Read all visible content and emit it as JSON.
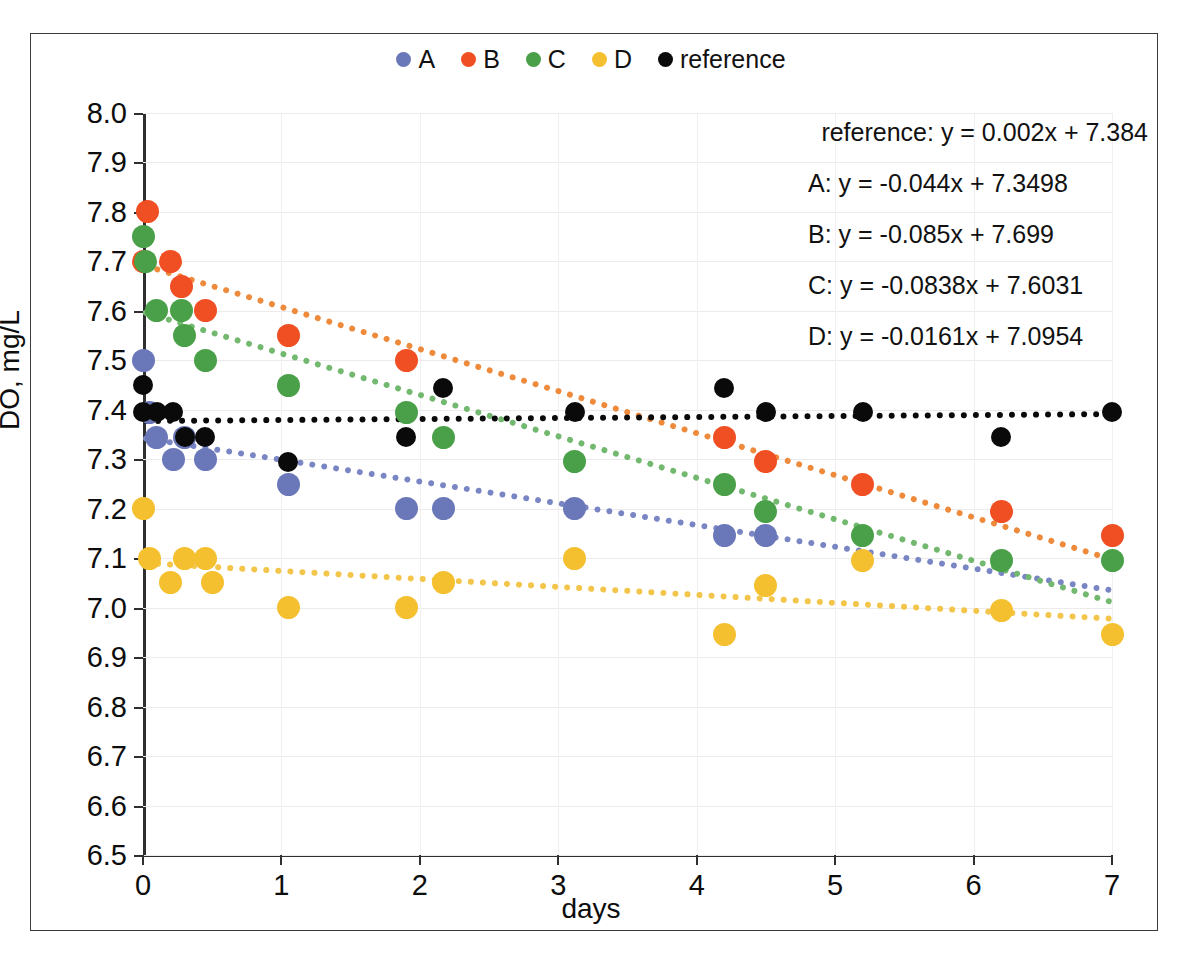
{
  "chart_data": {
    "type": "scatter",
    "title": "",
    "xlabel": "days",
    "ylabel": "DO, mg/L",
    "xlim": [
      0,
      7
    ],
    "ylim": [
      6.5,
      8.0
    ],
    "xticks": [
      "0",
      "1",
      "2",
      "3",
      "4",
      "5",
      "6",
      "7"
    ],
    "yticks": [
      "8.0",
      "7.9",
      "7.8",
      "7.7",
      "7.6",
      "7.5",
      "7.4",
      "7.3",
      "7.2",
      "7.1",
      "7.0",
      "6.9",
      "6.8",
      "6.7",
      "6.6",
      "6.5"
    ],
    "grid": true,
    "legend_position": "top-center",
    "series": [
      {
        "name": "A",
        "color": "#6a77b8",
        "points": [
          [
            0.0,
            7.5
          ],
          [
            0.05,
            7.395
          ],
          [
            0.1,
            7.345
          ],
          [
            0.22,
            7.3
          ],
          [
            0.3,
            7.345
          ],
          [
            0.45,
            7.3
          ],
          [
            1.05,
            7.25
          ],
          [
            1.9,
            7.2
          ],
          [
            2.17,
            7.2
          ],
          [
            3.12,
            7.2
          ],
          [
            4.2,
            7.145
          ],
          [
            4.5,
            7.145
          ]
        ],
        "trend": {
          "slope": -0.044,
          "intercept": 7.3498,
          "equation": "A: y = -0.044x + 7.3498"
        }
      },
      {
        "name": "B",
        "color": "#f04e23",
        "points": [
          [
            0.03,
            7.8
          ],
          [
            0.0,
            7.7
          ],
          [
            0.2,
            7.7
          ],
          [
            0.28,
            7.65
          ],
          [
            0.45,
            7.6
          ],
          [
            1.05,
            7.55
          ],
          [
            1.9,
            7.5
          ],
          [
            4.2,
            7.345
          ],
          [
            4.5,
            7.295
          ],
          [
            5.2,
            7.25
          ],
          [
            6.2,
            7.195
          ],
          [
            7.0,
            7.145
          ]
        ],
        "trend": {
          "slope": -0.085,
          "intercept": 7.699,
          "equation": "B: y = -0.085x + 7.699"
        }
      },
      {
        "name": "C",
        "color": "#44a councils"
      }
    ]
  },
  "legend": {
    "items": [
      {
        "label": "A",
        "color": "#6a77b8"
      },
      {
        "label": "B",
        "color": "#f04e23"
      },
      {
        "label": "C",
        "color": "#4aa048"
      },
      {
        "label": "D",
        "color": "#f5c030"
      },
      {
        "label": "reference",
        "color": "#0a0a0a"
      }
    ]
  },
  "axes": {
    "x_title": "days",
    "y_title": "DO, mg/L",
    "x_ticks": [
      "0",
      "1",
      "2",
      "3",
      "4",
      "5",
      "6",
      "7"
    ],
    "y_ticks": [
      "8.0",
      "7.9",
      "7.8",
      "7.7",
      "7.6",
      "7.5",
      "7.4",
      "7.3",
      "7.2",
      "7.1",
      "7.0",
      "6.9",
      "6.8",
      "6.7",
      "6.6",
      "6.5"
    ]
  },
  "equations": [
    "reference: y = 0.002x + 7.384",
    "A: y = -0.044x + 7.3498",
    "B: y = -0.085x + 7.699",
    "C: y = -0.0838x + 7.6031",
    "D: y = -0.0161x + 7.0954"
  ],
  "series_data": {
    "A": {
      "color": "#6a77b8",
      "trend_color": "#7a86c4",
      "slope": -0.044,
      "intercept": 7.3498,
      "points": [
        [
          0.0,
          7.5
        ],
        [
          0.05,
          7.395
        ],
        [
          0.1,
          7.345
        ],
        [
          0.22,
          7.3
        ],
        [
          0.3,
          7.345
        ],
        [
          0.45,
          7.3
        ],
        [
          1.05,
          7.25
        ],
        [
          1.9,
          7.2
        ],
        [
          2.17,
          7.2
        ],
        [
          3.12,
          7.2
        ],
        [
          4.2,
          7.145
        ],
        [
          4.5,
          7.145
        ]
      ]
    },
    "B": {
      "color": "#f04e23",
      "trend_color": "#ed8a3c",
      "slope": -0.085,
      "intercept": 7.699,
      "points": [
        [
          0.03,
          7.8
        ],
        [
          0.0,
          7.7
        ],
        [
          0.2,
          7.7
        ],
        [
          0.28,
          7.65
        ],
        [
          0.45,
          7.6
        ],
        [
          1.05,
          7.55
        ],
        [
          1.9,
          7.5
        ],
        [
          4.2,
          7.345
        ],
        [
          4.5,
          7.295
        ],
        [
          5.2,
          7.25
        ],
        [
          6.2,
          7.195
        ],
        [
          7.0,
          7.145
        ]
      ]
    },
    "C": {
      "color": "#4aa048",
      "trend_color": "#72b86e",
      "slope": -0.0838,
      "intercept": 7.6031,
      "points": [
        [
          0.0,
          7.75
        ],
        [
          0.02,
          7.7
        ],
        [
          0.1,
          7.6
        ],
        [
          0.28,
          7.6
        ],
        [
          0.3,
          7.55
        ],
        [
          0.45,
          7.5
        ],
        [
          1.05,
          7.45
        ],
        [
          1.9,
          7.395
        ],
        [
          2.17,
          7.345
        ],
        [
          3.12,
          7.295
        ],
        [
          4.2,
          7.25
        ],
        [
          4.5,
          7.195
        ],
        [
          5.2,
          7.145
        ],
        [
          6.2,
          7.095
        ],
        [
          7.0,
          7.095
        ]
      ]
    },
    "D": {
      "color": "#f5c030",
      "trend_color": "#f3c54a",
      "slope": -0.0161,
      "intercept": 7.0954,
      "points": [
        [
          0.0,
          7.2
        ],
        [
          0.05,
          7.1
        ],
        [
          0.2,
          7.05
        ],
        [
          0.3,
          7.1
        ],
        [
          0.45,
          7.1
        ],
        [
          0.5,
          7.05
        ],
        [
          1.05,
          7.0
        ],
        [
          1.9,
          7.0
        ],
        [
          2.17,
          7.05
        ],
        [
          3.12,
          7.1
        ],
        [
          4.2,
          6.945
        ],
        [
          4.5,
          7.045
        ],
        [
          5.2,
          7.095
        ],
        [
          6.2,
          6.995
        ],
        [
          7.0,
          6.945
        ]
      ]
    },
    "reference": {
      "color": "#0a0a0a",
      "trend_color": "#0a0a0a",
      "slope": 0.002,
      "intercept": 7.384,
      "points": [
        [
          0.0,
          7.45
        ],
        [
          0.0,
          7.395
        ],
        [
          0.1,
          7.395
        ],
        [
          0.22,
          7.395
        ],
        [
          0.3,
          7.345
        ],
        [
          0.45,
          7.345
        ],
        [
          1.05,
          7.295
        ],
        [
          1.9,
          7.345
        ],
        [
          2.17,
          7.445
        ],
        [
          3.12,
          7.395
        ],
        [
          4.2,
          7.445
        ],
        [
          4.5,
          7.395
        ],
        [
          5.2,
          7.395
        ],
        [
          6.2,
          7.345
        ],
        [
          7.0,
          7.395
        ]
      ]
    }
  }
}
